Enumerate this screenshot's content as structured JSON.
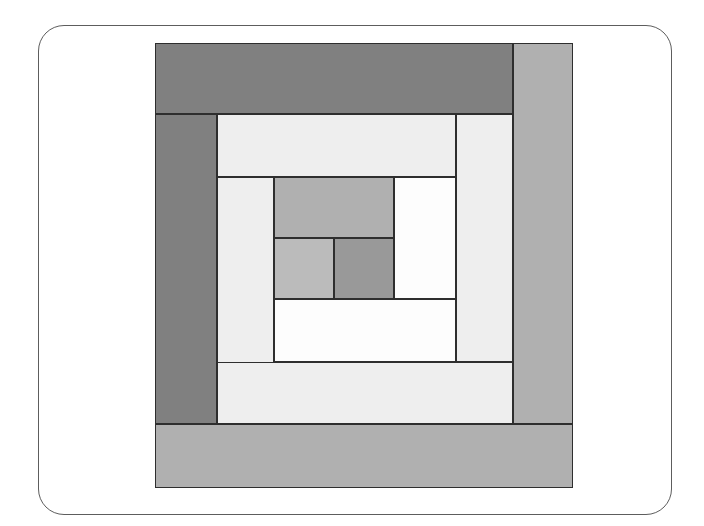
{
  "page": {
    "width": 704,
    "height": 526,
    "background": "#ffffff"
  },
  "card_frame": {
    "x": 38,
    "y": 25,
    "width": 634,
    "height": 490,
    "corner_radius": 26,
    "border_color": "#5d5d5d",
    "border_width": 1.4,
    "fill": "#ffffff"
  },
  "palette": {
    "dark_gray": "#808080",
    "medium_gray": "#b0b0b0",
    "medium_light_gray": "#bbbbbb",
    "mid_tone_gray": "#999999",
    "light_gray": "#eeeeee",
    "near_white": "#f8f8f8",
    "white": "#fdfdfd",
    "outline": "#2e2e2e"
  },
  "diagram": {
    "name": "log-cabin-quilt-block",
    "origin_x": 154,
    "origin_y": 42,
    "width": 418,
    "height": 445,
    "stroke": "#2e2e2e",
    "stroke_width": 1.6,
    "patches": [
      {
        "name": "round-5-top-dark-strip",
        "x": 0,
        "y": 0,
        "w": 358,
        "h": 71,
        "fill": "#808080"
      },
      {
        "name": "round-5-right-medium-strip",
        "x": 358,
        "y": 0,
        "w": 60,
        "h": 381,
        "fill": "#b0b0b0"
      },
      {
        "name": "round-5-left-dark-strip",
        "x": 0,
        "y": 71,
        "w": 62,
        "h": 310,
        "fill": "#808080"
      },
      {
        "name": "round-5-bottom-medium-strip",
        "x": 0,
        "y": 381,
        "w": 418,
        "h": 64,
        "fill": "#b0b0b0"
      },
      {
        "name": "round-4-top-light-strip",
        "x": 62,
        "y": 71,
        "w": 239,
        "h": 63,
        "fill": "#eeeeee"
      },
      {
        "name": "round-4-right-light-strip",
        "x": 301,
        "y": 71,
        "w": 57,
        "h": 248,
        "fill": "#eeeeee"
      },
      {
        "name": "round-4-left-light-strip",
        "x": 62,
        "y": 134,
        "w": 57,
        "h": 245,
        "fill": "#eeeeee"
      },
      {
        "name": "round-4-bottom-light-strip",
        "x": 62,
        "y": 319,
        "w": 296,
        "h": 62,
        "fill": "#eeeeee"
      },
      {
        "name": "round-3-right-white-strip",
        "x": 239,
        "y": 134,
        "w": 62,
        "h": 122,
        "fill": "#fdfdfd"
      },
      {
        "name": "round-3-bottom-white-strip",
        "x": 119,
        "y": 256,
        "w": 182,
        "h": 63,
        "fill": "#fdfdfd"
      },
      {
        "name": "round-2-center-top-gray",
        "x": 119,
        "y": 134,
        "w": 120,
        "h": 61,
        "fill": "#b0b0b0"
      },
      {
        "name": "round-1-center-left-gray",
        "x": 119,
        "y": 195,
        "w": 60,
        "h": 61,
        "fill": "#bbbbbb"
      },
      {
        "name": "round-1-center-right-gray",
        "x": 179,
        "y": 195,
        "w": 60,
        "h": 61,
        "fill": "#999999"
      }
    ]
  }
}
